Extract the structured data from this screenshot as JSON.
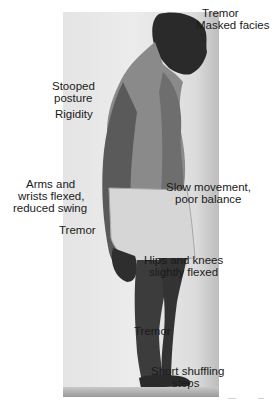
{
  "figure": {
    "labels": {
      "head_tremor": "Tremor",
      "masked_facies": "Masked facies",
      "stooped_posture_line1": "Stooped",
      "stooped_posture_line2": "posture",
      "rigidity": "Rigidity",
      "arms_line1": "Arms and",
      "arms_line2": "wrists flexed,",
      "arms_line3": "reduced swing",
      "hand_tremor": "Tremor",
      "slow_movement_line1": "Slow movement,",
      "slow_movement_line2": "poor balance",
      "hips_line1": "Hips and knees",
      "hips_line2": "slightly flexed",
      "leg_tremor": "Tremor",
      "steps_line1": "Short shuffling",
      "steps_line2": "steps"
    }
  }
}
